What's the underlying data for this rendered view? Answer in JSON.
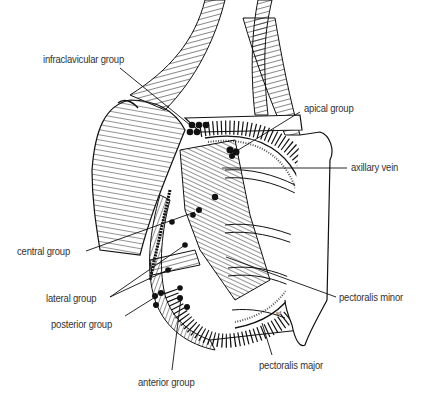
{
  "figure": {
    "labels": [
      {
        "id": "infraclavicular",
        "text": "infraclavicular group",
        "x": 43,
        "y": 53
      },
      {
        "id": "apical",
        "text": "apical group",
        "x": 304,
        "y": 102
      },
      {
        "id": "axillary-vein",
        "text": "axillary vein",
        "x": 351,
        "y": 161
      },
      {
        "id": "central",
        "text": "central group",
        "x": 17,
        "y": 245
      },
      {
        "id": "lateral",
        "text": "lateral group",
        "x": 46,
        "y": 292
      },
      {
        "id": "posterior",
        "text": "posterior group",
        "x": 51,
        "y": 318
      },
      {
        "id": "pectoralis-minor",
        "text": "pectoralis minor",
        "x": 339,
        "y": 291
      },
      {
        "id": "pectoralis-major",
        "text": "pectoralis major",
        "x": 259,
        "y": 359
      },
      {
        "id": "anterior",
        "text": "anterior group",
        "x": 138,
        "y": 376
      }
    ],
    "signature": "sd",
    "colors": {
      "ink": "#111111",
      "label": "#333333",
      "background": "#ffffff"
    }
  }
}
